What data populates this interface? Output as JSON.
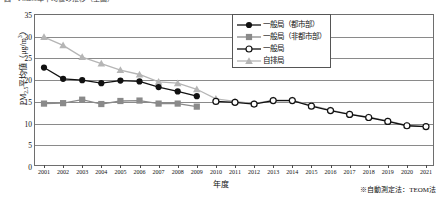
{
  "caption": {
    "text": "図　PM2.5年平均値の推移（全国）"
  },
  "axes": {
    "ytitle_main": "PM",
    "ytitle_sub": "2.5",
    "ytitle_rest": "平均値（μg/m",
    "ytitle_sup": "3",
    "ytitle_tail": "）",
    "xtitle": "年度",
    "yticks": [
      "35",
      "30",
      "25",
      "20",
      "15",
      "10",
      "5",
      "0"
    ],
    "ylim": [
      0,
      35
    ],
    "xticks": [
      "2001",
      "2002",
      "2003",
      "2004",
      "2005",
      "2006",
      "2007",
      "2008",
      "2009",
      "2010",
      "2011",
      "2012",
      "2013",
      "2014",
      "2015",
      "2016",
      "2017",
      "2018",
      "2019",
      "2020",
      "2021"
    ]
  },
  "legend": {
    "position": "top-right",
    "items": [
      {
        "label": "一般局（都市部）",
        "marker": "filled-circle",
        "color": "#111111"
      },
      {
        "label": "一般局（非都市部）",
        "marker": "filled-square",
        "color": "#8a8a8a"
      },
      {
        "label": "一般局",
        "marker": "open-circle",
        "color": "#111111"
      },
      {
        "label": "自排局",
        "marker": "filled-triangle",
        "color": "#b5b5b5"
      }
    ]
  },
  "footnote": {
    "text": "※自動測定法：TEOM法"
  },
  "chart_data": {
    "type": "line",
    "title": "図　PM2.5年平均値の推移（全国）",
    "xlabel": "年度",
    "ylabel": "PM2.5平均値（μg/m3）",
    "ylim": [
      0,
      35
    ],
    "grid": true,
    "legend_position": "top-right",
    "x": [
      "2001",
      "2002",
      "2003",
      "2004",
      "2005",
      "2006",
      "2007",
      "2008",
      "2009",
      "2010",
      "2011",
      "2012",
      "2013",
      "2014",
      "2015",
      "2016",
      "2017",
      "2018",
      "2019",
      "2020",
      "2021"
    ],
    "series": [
      {
        "name": "一般局（都市部）",
        "marker": "filled-circle",
        "color": "#111111",
        "points": [
          {
            "x": "2001",
            "y": 22.9
          },
          {
            "x": "2002",
            "y": 20.3
          },
          {
            "x": "2003",
            "y": 20.0
          },
          {
            "x": "2004",
            "y": 19.3
          },
          {
            "x": "2005",
            "y": 19.9
          },
          {
            "x": "2006",
            "y": 19.7
          },
          {
            "x": "2007",
            "y": 18.4
          },
          {
            "x": "2008",
            "y": 17.4
          },
          {
            "x": "2009",
            "y": 16.3
          }
        ]
      },
      {
        "name": "一般局（非都市部）",
        "marker": "filled-square",
        "color": "#8a8a8a",
        "points": [
          {
            "x": "2001",
            "y": 14.6
          },
          {
            "x": "2002",
            "y": 14.7
          },
          {
            "x": "2003",
            "y": 15.5
          },
          {
            "x": "2004",
            "y": 14.5
          },
          {
            "x": "2005",
            "y": 15.2
          },
          {
            "x": "2006",
            "y": 15.3
          },
          {
            "x": "2007",
            "y": 14.6
          },
          {
            "x": "2008",
            "y": 14.6
          },
          {
            "x": "2009",
            "y": 13.9
          }
        ]
      },
      {
        "name": "一般局",
        "marker": "open-circle",
        "color": "#111111",
        "points": [
          {
            "x": "2010",
            "y": 15.1
          },
          {
            "x": "2011",
            "y": 14.9
          },
          {
            "x": "2012",
            "y": 14.5
          },
          {
            "x": "2013",
            "y": 15.3
          },
          {
            "x": "2014",
            "y": 15.3
          },
          {
            "x": "2015",
            "y": 14.0
          },
          {
            "x": "2016",
            "y": 13.0
          },
          {
            "x": "2017",
            "y": 12.1
          },
          {
            "x": "2018",
            "y": 11.4
          },
          {
            "x": "2019",
            "y": 10.5
          },
          {
            "x": "2020",
            "y": 9.5
          },
          {
            "x": "2021",
            "y": 9.3
          }
        ]
      },
      {
        "name": "自排局",
        "marker": "filled-triangle",
        "color": "#b5b5b5",
        "points": [
          {
            "x": "2001",
            "y": 29.9
          },
          {
            "x": "2002",
            "y": 28.0
          },
          {
            "x": "2003",
            "y": 25.3
          },
          {
            "x": "2004",
            "y": 23.8
          },
          {
            "x": "2005",
            "y": 22.3
          },
          {
            "x": "2006",
            "y": 21.3
          },
          {
            "x": "2007",
            "y": 19.6
          },
          {
            "x": "2008",
            "y": 19.3
          },
          {
            "x": "2009",
            "y": 17.9
          },
          {
            "x": "2010",
            "y": 15.7
          },
          {
            "x": "2011",
            "y": 15.1
          },
          {
            "x": "2012",
            "y": 14.6
          },
          {
            "x": "2013",
            "y": 15.4
          },
          {
            "x": "2014",
            "y": 15.4
          },
          {
            "x": "2015",
            "y": 14.2
          },
          {
            "x": "2016",
            "y": 13.1
          },
          {
            "x": "2017",
            "y": 12.2
          },
          {
            "x": "2018",
            "y": 11.5
          },
          {
            "x": "2019",
            "y": 10.6
          },
          {
            "x": "2020",
            "y": 9.6
          },
          {
            "x": "2021",
            "y": 9.3
          }
        ]
      }
    ]
  }
}
